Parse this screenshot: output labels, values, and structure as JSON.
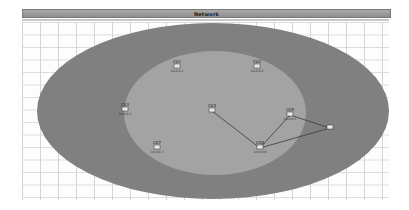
{
  "window": {
    "title": "Network"
  },
  "colors": {
    "outer_zone": "#808080",
    "inner_zone": "#a3a3a3",
    "link": "#3a3a3a",
    "grid": "#d4d4d4"
  },
  "zones": [
    {
      "name": "outer-zone",
      "cx": 213,
      "cy": 111,
      "rx": 176,
      "ry": 88
    },
    {
      "name": "inner-zone",
      "cx": 215,
      "cy": 113,
      "rx": 91,
      "ry": 62
    }
  ],
  "nodes": [
    {
      "id": "n1",
      "x": 177,
      "y": 67,
      "label": "C01",
      "sub": "10.0.0.1"
    },
    {
      "id": "n2",
      "x": 257,
      "y": 67,
      "label": "C02",
      "sub": "10.0.0.2"
    },
    {
      "id": "n3",
      "x": 125,
      "y": 110,
      "label": "C03",
      "sub": "10.0.0.3"
    },
    {
      "id": "n4",
      "x": 212,
      "y": 111,
      "label": "C04",
      "sub": ""
    },
    {
      "id": "n5",
      "x": 290,
      "y": 115,
      "label": "C05",
      "sub": "10.0.0.5"
    },
    {
      "id": "n6",
      "x": 330,
      "y": 128,
      "label": "",
      "sub": ""
    },
    {
      "id": "n7",
      "x": 157,
      "y": 148,
      "label": "C07",
      "sub": "10.0.0.7"
    },
    {
      "id": "n8",
      "x": 260,
      "y": 148,
      "label": "C08",
      "sub": "10.0.0.8"
    }
  ],
  "links": [
    {
      "from": "n4",
      "to": "n8"
    },
    {
      "from": "n8",
      "to": "n5"
    },
    {
      "from": "n8",
      "to": "n6"
    },
    {
      "from": "n5",
      "to": "n6"
    }
  ]
}
